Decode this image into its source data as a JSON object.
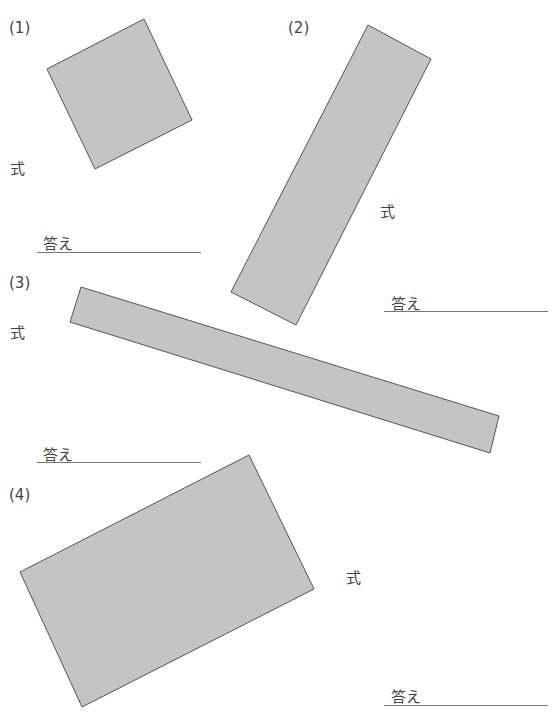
{
  "problems": [
    {
      "number": "(1)",
      "formula_label": "式",
      "answer_label": "答え",
      "shape": {
        "type": "rotated-square",
        "points": "47,69 144,19 192,120 95,169"
      }
    },
    {
      "number": "(2)",
      "formula_label": "式",
      "answer_label": "答え",
      "shape": {
        "type": "rotated-rectangle",
        "points": "368,25 431,59 296,325 231,292"
      }
    },
    {
      "number": "(3)",
      "formula_label": "式",
      "answer_label": "答え",
      "shape": {
        "type": "rotated-rectangle",
        "points": "81,287 499,416 490,453 70,322"
      }
    },
    {
      "number": "(4)",
      "formula_label": "式",
      "answer_label": "答え",
      "shape": {
        "type": "rotated-rectangle",
        "points": "20,572 249,455 314,589 82,707"
      }
    }
  ],
  "colors": {
    "fill": "#c4c4c4",
    "stroke": "#555555",
    "line": "#777777"
  }
}
